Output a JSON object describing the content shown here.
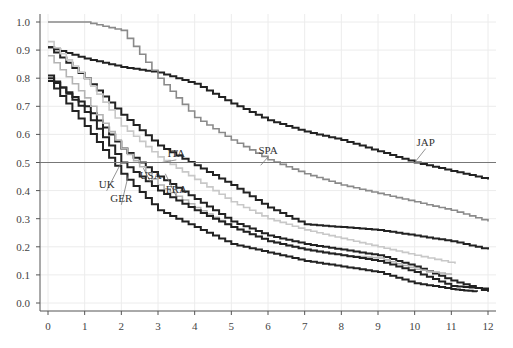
{
  "chart_data": {
    "type": "line",
    "title": "",
    "xlabel": "",
    "ylabel": "",
    "xlim": [
      0,
      12
    ],
    "ylim": [
      0,
      1.0
    ],
    "grid": true,
    "x_ticks": [
      "0",
      "1",
      "2",
      "3",
      "4",
      "5",
      "6",
      "7",
      "8",
      "9",
      "10",
      "11",
      "12"
    ],
    "y_ticks": [
      "0.0",
      "0.1",
      "0.2",
      "0.3",
      "0.4",
      "0.5",
      "0.6",
      "0.7",
      "0.8",
      "0.9",
      "1.0"
    ],
    "reference_line": {
      "y": 0.5
    },
    "series": [
      {
        "name": "JAP",
        "color": "#222222",
        "x": [
          0,
          1,
          2,
          3,
          4,
          5,
          6,
          7,
          8,
          9,
          10,
          11,
          12
        ],
        "values": [
          0.91,
          0.87,
          0.84,
          0.82,
          0.78,
          0.71,
          0.65,
          0.61,
          0.58,
          0.54,
          0.5,
          0.47,
          0.44
        ]
      },
      {
        "name": "SPA",
        "color": "#8a8a8a",
        "x": [
          0,
          1,
          2,
          3,
          4,
          5,
          6,
          7,
          8,
          9,
          10,
          11,
          12
        ],
        "values": [
          1.0,
          1.0,
          0.97,
          0.8,
          0.66,
          0.58,
          0.51,
          0.46,
          0.42,
          0.39,
          0.36,
          0.33,
          0.29
        ]
      },
      {
        "name": "ITA",
        "color": "#222222",
        "x": [
          0,
          1,
          2,
          3,
          4,
          5,
          6,
          7,
          8,
          9,
          10,
          11,
          12
        ],
        "values": [
          0.91,
          0.8,
          0.67,
          0.56,
          0.49,
          0.42,
          0.34,
          0.28,
          0.27,
          0.26,
          0.24,
          0.22,
          0.19
        ]
      },
      {
        "name": "FRA",
        "color": "#c8c8c8",
        "x": [
          0,
          1,
          2,
          3,
          4,
          5,
          6,
          7,
          8,
          9,
          10,
          11.1
        ],
        "values": [
          0.93,
          0.8,
          0.63,
          0.52,
          0.44,
          0.36,
          0.3,
          0.26,
          0.23,
          0.2,
          0.17,
          0.14
        ]
      },
      {
        "name": "USA",
        "color": "#222222",
        "x": [
          0,
          1,
          2,
          3,
          4,
          5,
          6,
          7,
          8,
          9,
          10,
          11,
          12
        ],
        "values": [
          0.8,
          0.7,
          0.55,
          0.45,
          0.37,
          0.29,
          0.24,
          0.21,
          0.19,
          0.17,
          0.13,
          0.08,
          0.04
        ]
      },
      {
        "name": "",
        "color": "#b4b4b4",
        "x": [
          0,
          1,
          2,
          3,
          4,
          5,
          6,
          7,
          8,
          9,
          10,
          11
        ],
        "values": [
          0.88,
          0.73,
          0.55,
          0.42,
          0.34,
          0.27,
          0.22,
          0.19,
          0.17,
          0.16,
          0.12,
          0.1
        ]
      },
      {
        "name": "UK",
        "color": "#222222",
        "x": [
          0,
          1,
          2,
          3,
          4,
          5,
          6,
          7,
          8,
          9,
          10,
          11,
          12
        ],
        "values": [
          0.81,
          0.68,
          0.5,
          0.4,
          0.33,
          0.27,
          0.22,
          0.19,
          0.17,
          0.15,
          0.11,
          0.06,
          0.05
        ]
      },
      {
        "name": "GER",
        "color": "#222222",
        "x": [
          0,
          1,
          2,
          3,
          4,
          5,
          6,
          7,
          8,
          9,
          10,
          11,
          11.7
        ],
        "values": [
          0.79,
          0.63,
          0.46,
          0.33,
          0.27,
          0.21,
          0.18,
          0.15,
          0.13,
          0.11,
          0.07,
          0.05,
          0.04
        ]
      }
    ],
    "annotations": [
      {
        "text": "JAP",
        "x": 10.3,
        "y": 0.56,
        "leader_to": [
          10.0,
          0.5
        ]
      },
      {
        "text": "SPA",
        "x": 6.0,
        "y": 0.53,
        "leader_to": [
          5.8,
          0.49
        ]
      },
      {
        "text": "ITA",
        "x": 3.5,
        "y": 0.52,
        "leader_to": [
          3.1,
          0.5
        ]
      },
      {
        "text": "USA",
        "x": 2.8,
        "y": 0.44,
        "leader_to": [
          2.6,
          0.48
        ]
      },
      {
        "text": "FRA",
        "x": 3.5,
        "y": 0.39,
        "leader_to": [
          3.2,
          0.46
        ]
      },
      {
        "text": "UK",
        "x": 1.6,
        "y": 0.41,
        "leader_to": [
          2.0,
          0.5
        ]
      },
      {
        "text": "GER",
        "x": 2.0,
        "y": 0.36,
        "leader_to": [
          2.2,
          0.46
        ]
      }
    ]
  }
}
